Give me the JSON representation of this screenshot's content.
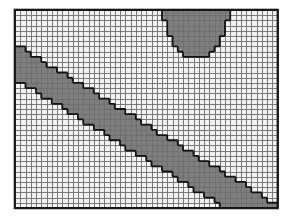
{
  "figure": {
    "name": "rasterized-contour-grid",
    "type": "raster-classification-grid",
    "width_px": 288,
    "height_px": 220,
    "background_color": "#ffffff"
  },
  "grid": {
    "origin_x_px": 15,
    "origin_y_px": 10,
    "cols": 50,
    "rows": 38,
    "cell_w_px": 5.25,
    "cell_h_px": 5.21,
    "gridline_color": "#6e6e6e",
    "gridline_width_px": 0.9,
    "border_color": "#1a1a1a",
    "border_width_px": 1.6,
    "outline_color": "#111111",
    "outline_width_px": 1.8
  },
  "legend": {
    "classes": [
      {
        "id": 0,
        "label": "class-lightest",
        "color": "#f2f2f2"
      },
      {
        "id": 1,
        "label": "class-light",
        "color": "#e2e2e2"
      },
      {
        "id": 2,
        "label": "class-medium",
        "color": "#a8a8a8"
      },
      {
        "id": 3,
        "label": "class-dark",
        "color": "#7e7e7e"
      }
    ]
  },
  "chart_data": {
    "type": "heatmap",
    "title": "",
    "xlabel": "",
    "ylabel": "",
    "cols": 50,
    "rows": 38,
    "value_labels": [
      "lightest",
      "light",
      "medium",
      "dark"
    ],
    "colors": [
      "#f2f2f2",
      "#e2e2e2",
      "#a8a8a8",
      "#7e7e7e"
    ],
    "regions": [
      {
        "name": "background-medium-field",
        "class": 2,
        "rule": "default"
      },
      {
        "name": "upper-left-light-wedge",
        "class": 0,
        "rule": "band",
        "desc": "Light band running upper-left to lower-right above the first dark stripe",
        "poly": [
          [
            0,
            0
          ],
          [
            10,
            0
          ],
          [
            2,
            9
          ],
          [
            0,
            9
          ]
        ]
      },
      {
        "name": "upper-white-diagonal-stripe",
        "class": 0,
        "rule": "diagonal-stripe",
        "slope": -1.0,
        "intercept_lo": 8.0,
        "intercept_hi": 12.5,
        "x_range": [
          0,
          30
        ],
        "y_range": [
          0,
          34
        ]
      },
      {
        "name": "second-white-diagonal-stripe",
        "class": 0,
        "rule": "diagonal-stripe",
        "slope": -1.0,
        "intercept_lo": 17.5,
        "intercept_hi": 21.5,
        "x_range": [
          0,
          34
        ],
        "y_range": [
          0,
          37
        ]
      },
      {
        "name": "upper-right-light-field",
        "class": 0,
        "rule": "diagonal-halfplane-above",
        "slope": -1.0,
        "intercept": 26.5,
        "x_range": [
          20,
          50
        ],
        "y_range": [
          0,
          22
        ]
      },
      {
        "name": "top-dark-bowl",
        "class": 3,
        "rule": "bowl",
        "x_range": [
          28,
          41
        ],
        "y_top": 0,
        "y_bottom": 9
      },
      {
        "name": "lower-left-light-field",
        "class": 0,
        "rule": "diagonal-halfplane-below-left",
        "slope": 1.0,
        "offset": -12.0,
        "x_range": [
          0,
          30
        ],
        "y_range": [
          19,
          38
        ]
      },
      {
        "name": "main-dark-diagonal-band",
        "class": 3,
        "rule": "diagonal-stripe-asc",
        "slope": 0.62,
        "intercept_lo": 6.5,
        "intercept_hi": 13.5,
        "x_range": [
          0,
          50
        ],
        "y_range": [
          0,
          38
        ]
      },
      {
        "name": "lower-right-light-field",
        "class": 0,
        "rule": "diagonal-halfplane-below-right",
        "slope": 0.62,
        "intercept": 13.5,
        "x_range": [
          18,
          50
        ],
        "y_range": [
          18,
          38
        ]
      }
    ],
    "legend_position": "none",
    "grid": true,
    "axis_ranges": {
      "x": [
        0,
        50
      ],
      "y": [
        0,
        38
      ]
    }
  }
}
